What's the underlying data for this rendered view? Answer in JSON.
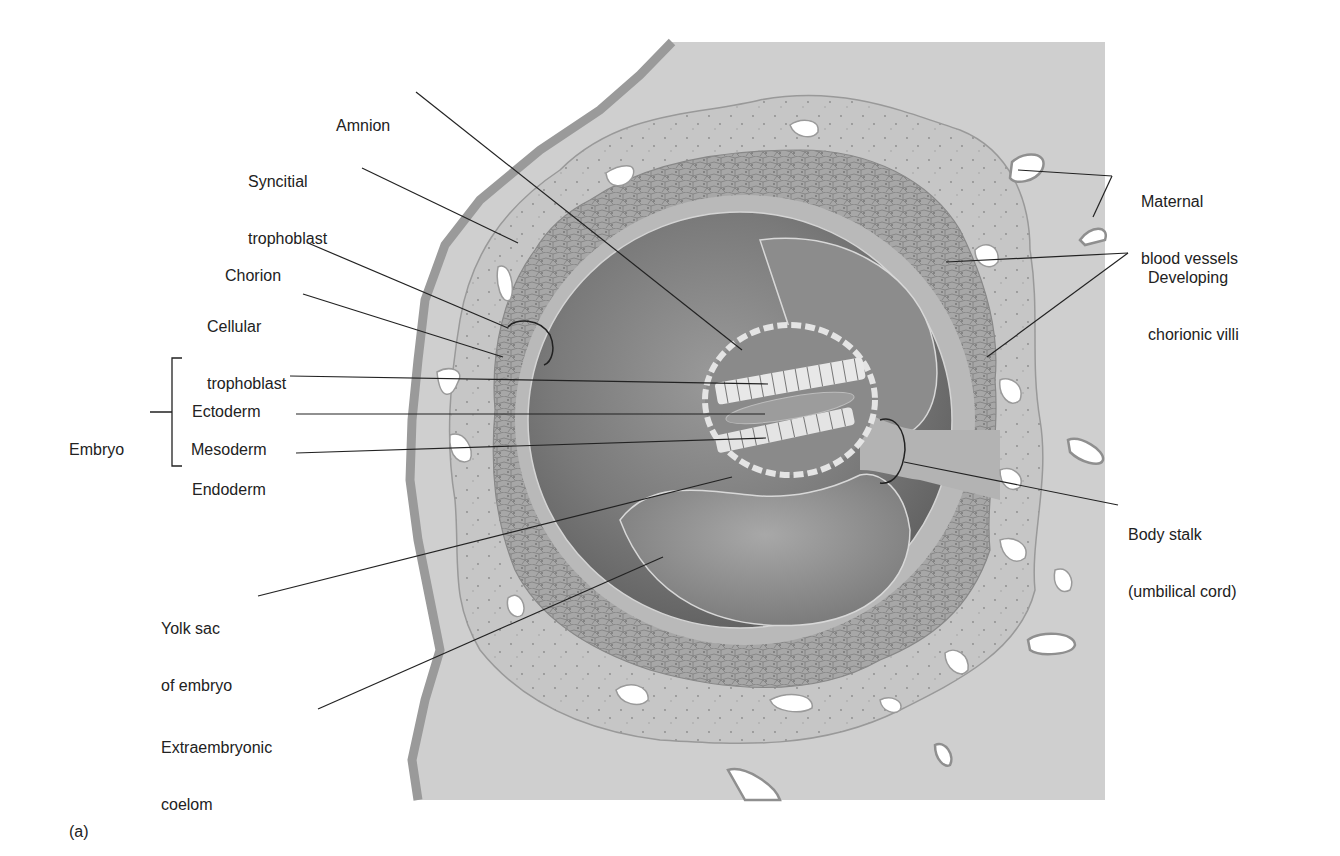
{
  "figure": {
    "panel_label": "(a)",
    "colors": {
      "background": "#ffffff",
      "maternal_tissue": "#cfcfcf",
      "syncitial_layer": "#c4c4c4",
      "cellular_trophoblast": "#a9a9a9",
      "chorion_inner": "#b8b8b8",
      "coelom_dark": "#6e6e6e",
      "coelom_light": "#8f8f8f",
      "vessel_fill": "#ffffff",
      "leader_line": "#222222",
      "label_text": "#222222"
    }
  },
  "labels": {
    "amnion": "Amnion",
    "syncitial": [
      "Syncitial",
      "trophoblast"
    ],
    "chorion": "Chorion",
    "cellular": [
      "Cellular",
      "trophoblast"
    ],
    "embryo": "Embryo",
    "ectoderm": "Ectoderm",
    "mesoderm": "Mesoderm",
    "endoderm": "Endoderm",
    "yolk_sac": [
      "Yolk sac",
      "of embryo"
    ],
    "extraembryonic": [
      "Extraembryonic",
      "coelom"
    ],
    "maternal": [
      "Maternal",
      "blood vessels"
    ],
    "villi": [
      "Developing",
      "chorionic villi"
    ],
    "body_stalk": [
      "Body stalk",
      "(umbilical cord)"
    ]
  }
}
